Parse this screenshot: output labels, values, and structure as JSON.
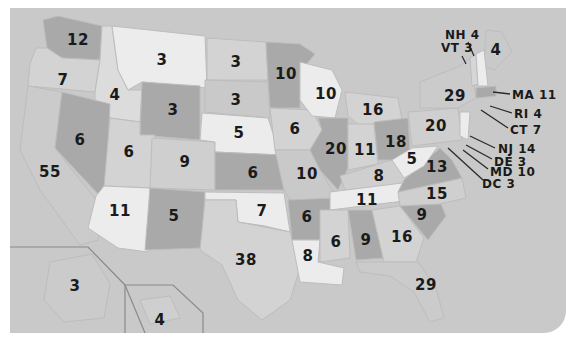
{
  "map": {
    "title": "US Electoral Votes by State",
    "colors": {
      "background": "#c9c9c9",
      "light": "#ececec",
      "mid": "#cfcfcf",
      "dark": "#a9a9a9",
      "text": "#1a1a1a"
    },
    "states": [
      {
        "abbr": "WA",
        "votes": "12"
      },
      {
        "abbr": "OR",
        "votes": "7"
      },
      {
        "abbr": "CA",
        "votes": "55"
      },
      {
        "abbr": "ID",
        "votes": "4"
      },
      {
        "abbr": "NV",
        "votes": "6"
      },
      {
        "abbr": "MT",
        "votes": "3"
      },
      {
        "abbr": "WY",
        "votes": "3"
      },
      {
        "abbr": "UT",
        "votes": "6"
      },
      {
        "abbr": "AZ",
        "votes": "11"
      },
      {
        "abbr": "CO",
        "votes": "9"
      },
      {
        "abbr": "NM",
        "votes": "5"
      },
      {
        "abbr": "ND",
        "votes": "3"
      },
      {
        "abbr": "SD",
        "votes": "3"
      },
      {
        "abbr": "NE",
        "votes": "5"
      },
      {
        "abbr": "KS",
        "votes": "6"
      },
      {
        "abbr": "OK",
        "votes": "7"
      },
      {
        "abbr": "TX",
        "votes": "38"
      },
      {
        "abbr": "MN",
        "votes": "10"
      },
      {
        "abbr": "IA",
        "votes": "6"
      },
      {
        "abbr": "MO",
        "votes": "10"
      },
      {
        "abbr": "AR",
        "votes": "6"
      },
      {
        "abbr": "LA",
        "votes": "8"
      },
      {
        "abbr": "WI",
        "votes": "10"
      },
      {
        "abbr": "IL",
        "votes": "20"
      },
      {
        "abbr": "MI",
        "votes": "16"
      },
      {
        "abbr": "IN",
        "votes": "11"
      },
      {
        "abbr": "OH",
        "votes": "18"
      },
      {
        "abbr": "KY",
        "votes": "8"
      },
      {
        "abbr": "TN",
        "votes": "11"
      },
      {
        "abbr": "MS",
        "votes": "6"
      },
      {
        "abbr": "AL",
        "votes": "9"
      },
      {
        "abbr": "GA",
        "votes": "16"
      },
      {
        "abbr": "FL",
        "votes": "29"
      },
      {
        "abbr": "SC",
        "votes": "9"
      },
      {
        "abbr": "NC",
        "votes": "15"
      },
      {
        "abbr": "VA",
        "votes": "13"
      },
      {
        "abbr": "WV",
        "votes": "5"
      },
      {
        "abbr": "PA",
        "votes": "20"
      },
      {
        "abbr": "NY",
        "votes": "29"
      },
      {
        "abbr": "ME",
        "votes": "4"
      },
      {
        "abbr": "AK",
        "votes": "3"
      },
      {
        "abbr": "HI",
        "votes": "4"
      }
    ],
    "callouts": [
      {
        "label": "NH 4"
      },
      {
        "label": "VT 3"
      },
      {
        "label": "MA 11"
      },
      {
        "label": "RI 4"
      },
      {
        "label": "CT 7"
      },
      {
        "label": "NJ 14"
      },
      {
        "label": "DE 3"
      },
      {
        "label": "MD 10"
      },
      {
        "label": "DC 3"
      }
    ]
  }
}
